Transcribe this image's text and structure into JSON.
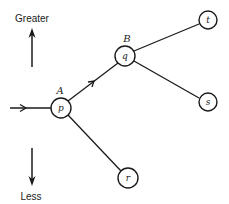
{
  "diagram": {
    "type": "tree",
    "axis": {
      "top_label": "Greater",
      "bottom_label": "Less"
    },
    "input_arrow": {
      "x1": 10,
      "y1": 108,
      "x2": 51,
      "y2": 108
    },
    "nodes": [
      {
        "id": "p",
        "label": "p",
        "group": "A",
        "cx": 61,
        "cy": 108,
        "r": 10
      },
      {
        "id": "q",
        "label": "q",
        "group": "B",
        "cx": 125,
        "cy": 56,
        "r": 10
      },
      {
        "id": "t",
        "label": "t",
        "cx": 208,
        "cy": 20,
        "r": 9
      },
      {
        "id": "s",
        "label": "s",
        "cx": 208,
        "cy": 102,
        "r": 9
      },
      {
        "id": "r",
        "label": "r",
        "cx": 128,
        "cy": 178,
        "r": 10
      }
    ],
    "edges": [
      {
        "from": "p",
        "to": "q",
        "arrow": true
      },
      {
        "from": "p",
        "to": "r",
        "arrow": false
      },
      {
        "from": "q",
        "to": "t",
        "arrow": false
      },
      {
        "from": "q",
        "to": "s",
        "arrow": false
      }
    ],
    "group_labels": {
      "A": "A",
      "B": "B"
    },
    "node_labels": {
      "p": "p",
      "q": "q",
      "t": "t",
      "s": "s",
      "r": "r"
    }
  }
}
